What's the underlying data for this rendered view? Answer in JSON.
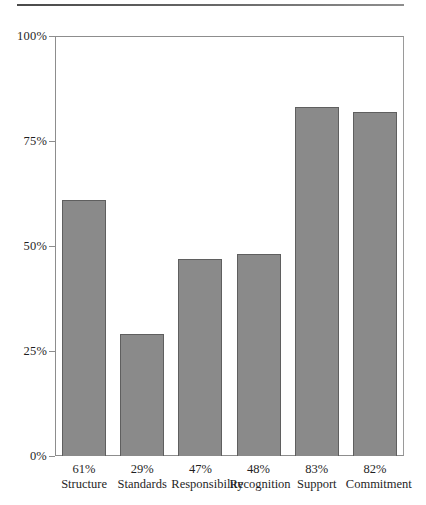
{
  "chart_data": {
    "type": "bar",
    "title": "",
    "subtitle": "",
    "xlabel": "",
    "ylabel": "",
    "categories": [
      "Structure",
      "Standards",
      "Responsibility",
      "Recognition",
      "Support",
      "Commitment"
    ],
    "values": [
      61,
      29,
      47,
      48,
      83,
      82
    ],
    "value_labels": [
      "61%",
      "29%",
      "47%",
      "48%",
      "83%",
      "82%"
    ],
    "ylim": [
      0,
      100
    ],
    "yticks": [
      0,
      25,
      50,
      75,
      100
    ],
    "ytick_labels": [
      "0%",
      "25%",
      "50%",
      "75%",
      "100%"
    ],
    "grid": false,
    "legend": null,
    "bar_color": "#8a8a8a",
    "bar_border_color": "#5f5f5f",
    "axis_color": "#8d8d8d",
    "background": "#ffffff",
    "annotations": []
  },
  "decor": {
    "top_rule": "horizontal-rule"
  }
}
